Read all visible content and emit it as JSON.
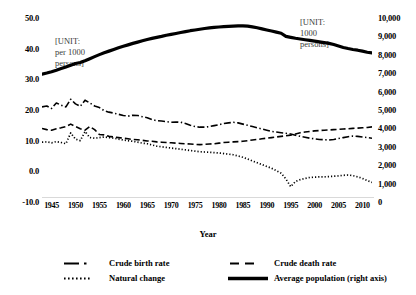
{
  "chart_data": {
    "type": "line",
    "title": "",
    "xlabel": "Year",
    "ylabel": "",
    "grid": false,
    "legend_position": "bottom",
    "x": [
      1943,
      1944,
      1945,
      1946,
      1947,
      1948,
      1949,
      1950,
      1951,
      1952,
      1953,
      1954,
      1955,
      1956,
      1957,
      1958,
      1959,
      1960,
      1961,
      1962,
      1963,
      1964,
      1965,
      1966,
      1967,
      1968,
      1969,
      1970,
      1971,
      1972,
      1973,
      1974,
      1975,
      1976,
      1977,
      1978,
      1979,
      1980,
      1981,
      1982,
      1983,
      1984,
      1985,
      1986,
      1987,
      1988,
      1989,
      1990,
      1991,
      1992,
      1993,
      1994,
      1995,
      1996,
      1997,
      1998,
      1999,
      2000,
      2001,
      2002,
      2003,
      2004,
      2005,
      2006,
      2007,
      2008,
      2009,
      2010,
      2011,
      2012
    ],
    "xticks": [
      "1945",
      "1950",
      "1955",
      "1960",
      "1965",
      "1970",
      "1975",
      "1980",
      "1985",
      "1990",
      "1995",
      "2000",
      "2005",
      "2010"
    ],
    "left_axis": {
      "ticks": [
        "50.0",
        "40.0",
        "30.0",
        "20.0",
        "10.0",
        "0.0",
        "-10.0"
      ],
      "values": [
        50,
        40,
        30,
        20,
        10,
        0,
        -10
      ],
      "ylim": [
        -10,
        50
      ],
      "unit_note": "[UNIT:\nper 1000\npersons]"
    },
    "right_axis": {
      "ticks": [
        "10,000",
        "9,000",
        "8,000",
        "7,000",
        "6,000",
        "5,000",
        "4,000",
        "3,000",
        "2,000",
        "1,000",
        "0"
      ],
      "values": [
        10000,
        9000,
        8000,
        7000,
        6000,
        5000,
        4000,
        3000,
        2000,
        1000,
        0
      ],
      "ylim": [
        0,
        10000
      ],
      "unit_note": "[UNIT:\n1000\npersons]"
    },
    "series": [
      {
        "name": "Crude birth rate",
        "style": "dash-dot",
        "axis": "left",
        "values": [
          21.0,
          21.3,
          20.5,
          22.3,
          21.6,
          21.0,
          23.5,
          22.0,
          21.2,
          23.2,
          22.3,
          21.3,
          20.8,
          19.8,
          19.3,
          19.0,
          18.6,
          18.2,
          18.0,
          18.3,
          18.2,
          17.8,
          17.5,
          16.9,
          16.5,
          16.4,
          16.2,
          16.0,
          16.1,
          16.0,
          15.6,
          15.0,
          14.6,
          14.4,
          14.4,
          14.6,
          14.9,
          15.2,
          15.6,
          15.8,
          16.0,
          15.8,
          15.4,
          15.0,
          14.6,
          14.2,
          13.8,
          13.4,
          13.0,
          12.8,
          12.6,
          12.4,
          12.2,
          11.8,
          11.4,
          11.1,
          10.8,
          10.6,
          10.4,
          10.3,
          10.2,
          10.4,
          10.7,
          11.0,
          11.3,
          11.5,
          11.4,
          11.2,
          11.0,
          10.8
        ]
      },
      {
        "name": "Crude death rate",
        "style": "dash",
        "axis": "left",
        "values": [
          14.0,
          13.6,
          13.4,
          13.9,
          14.2,
          14.6,
          15.4,
          14.6,
          13.9,
          13.4,
          14.6,
          13.6,
          12.0,
          11.9,
          11.4,
          11.2,
          11.0,
          10.8,
          10.6,
          10.4,
          10.3,
          10.1,
          9.9,
          9.8,
          9.6,
          9.5,
          9.4,
          9.3,
          9.2,
          9.1,
          9.0,
          8.9,
          8.8,
          8.7,
          8.8,
          8.9,
          9.0,
          9.2,
          9.4,
          9.5,
          9.6,
          9.7,
          9.8,
          10.0,
          10.2,
          10.4,
          10.6,
          10.8,
          11.0,
          11.2,
          11.4,
          11.6,
          11.8,
          12.2,
          12.6,
          12.8,
          13.0,
          13.2,
          13.3,
          13.4,
          13.5,
          13.6,
          13.7,
          13.8,
          13.9,
          14.0,
          14.1,
          14.2,
          14.3,
          14.5
        ]
      },
      {
        "name": "Natural change",
        "style": "dot",
        "axis": "left",
        "values": [
          9.5,
          9.6,
          9.3,
          9.7,
          9.4,
          9.0,
          12.5,
          10.5,
          10.0,
          13.0,
          11.0,
          10.8,
          11.0,
          11.2,
          11.0,
          10.8,
          10.5,
          10.2,
          10.0,
          9.8,
          9.5,
          9.2,
          9.0,
          8.6,
          8.2,
          8.0,
          7.8,
          7.6,
          7.4,
          7.2,
          7.0,
          6.8,
          6.6,
          6.4,
          6.3,
          6.2,
          6.1,
          6.0,
          5.8,
          5.6,
          5.4,
          5.0,
          4.6,
          4.0,
          3.4,
          2.8,
          2.2,
          1.6,
          1.0,
          0.2,
          -0.6,
          -2.5,
          -5.0,
          -3.3,
          -2.7,
          -2.3,
          -2.0,
          -1.9,
          -1.8,
          -1.8,
          -1.7,
          -1.6,
          -1.5,
          -1.3,
          -1.2,
          -1.4,
          -1.8,
          -2.3,
          -3.0,
          -3.6
        ]
      },
      {
        "name": "Average population (right axis)",
        "style": "solid-heavy",
        "axis": "right",
        "values": [
          6950,
          7010,
          7080,
          7160,
          7250,
          7340,
          7430,
          7530,
          7580,
          7680,
          7790,
          7900,
          8010,
          8110,
          8200,
          8290,
          8380,
          8460,
          8540,
          8620,
          8690,
          8760,
          8830,
          8890,
          8950,
          9000,
          9060,
          9110,
          9160,
          9210,
          9260,
          9310,
          9350,
          9390,
          9430,
          9460,
          9490,
          9510,
          9530,
          9550,
          9560,
          9570,
          9575,
          9560,
          9520,
          9470,
          9410,
          9350,
          9290,
          9230,
          9170,
          9000,
          8950,
          8900,
          8860,
          8820,
          8780,
          8740,
          8700,
          8660,
          8620,
          8560,
          8480,
          8400,
          8340,
          8290,
          8250,
          8200,
          8140,
          8100
        ]
      }
    ]
  },
  "legend": {
    "items": [
      {
        "label": "Crude birth rate",
        "style": "dash-dot"
      },
      {
        "label": "Crude death rate",
        "style": "dash"
      },
      {
        "label": "Natural change",
        "style": "dot"
      },
      {
        "label": "Average population (right axis)",
        "style": "solid-heavy"
      }
    ]
  },
  "colors": {
    "line": "#000000",
    "text": "#000000",
    "note": "#3a3a3a",
    "axis": "#d9d9d9"
  }
}
